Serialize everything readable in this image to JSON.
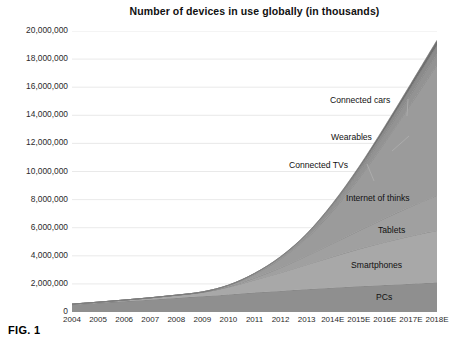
{
  "figure": {
    "caption": "FIG. 1"
  },
  "chart_data": {
    "type": "area",
    "stacked": true,
    "title": "Number of devices in use globally (in thousands)",
    "xlabel": "",
    "ylabel": "",
    "grid": true,
    "legend_position": "inline-annotations",
    "categories": [
      "2004",
      "2005",
      "2006",
      "2007",
      "2008",
      "2009",
      "2010",
      "2011",
      "2012",
      "2013",
      "2014E",
      "2015E",
      "2016E",
      "2017E",
      "2018E"
    ],
    "x": [
      2004,
      2005,
      2006,
      2007,
      2008,
      2009,
      2010,
      2011,
      2012,
      2013,
      2014,
      2015,
      2016,
      2017,
      2018
    ],
    "ylim": [
      0,
      20000000
    ],
    "ytick_values": [
      0,
      2000000,
      4000000,
      6000000,
      8000000,
      10000000,
      12000000,
      14000000,
      16000000,
      18000000,
      20000000
    ],
    "ytick_labels": [
      "0",
      "2,000,000",
      "4,000,000",
      "6,000,000",
      "8,000,000",
      "10,000,000",
      "12,000,000",
      "14,000,000",
      "16,000,000",
      "18,000,000",
      "20,000,000"
    ],
    "series": [
      {
        "name": "PCs",
        "color": "#8f8f8f",
        "values": [
          520000,
          640000,
          760000,
          880000,
          1000000,
          1120000,
          1250000,
          1380000,
          1500000,
          1620000,
          1730000,
          1830000,
          1920000,
          2010000,
          2100000
        ]
      },
      {
        "name": "Smartphones",
        "color": "#a8a8a8",
        "values": [
          40000,
          60000,
          90000,
          130000,
          190000,
          280000,
          520000,
          900000,
          1300000,
          1750000,
          2200000,
          2650000,
          3050000,
          3400000,
          3700000
        ]
      },
      {
        "name": "Tablets",
        "color": "#a0a0a0",
        "values": [
          0,
          0,
          0,
          0,
          0,
          0,
          30000,
          140000,
          350000,
          620000,
          950000,
          1300000,
          1700000,
          2100000,
          2500000
        ]
      },
      {
        "name": "Internet of thinks",
        "color": "#9b9b9b",
        "values": [
          0,
          0,
          0,
          0,
          10000,
          30000,
          90000,
          260000,
          620000,
          1250000,
          2300000,
          3700000,
          5400000,
          7300000,
          9300000
        ]
      },
      {
        "name": "Connected TVs",
        "color": "#939393",
        "values": [
          0,
          0,
          0,
          0,
          0,
          0,
          20000,
          60000,
          130000,
          230000,
          350000,
          470000,
          580000,
          680000,
          760000
        ]
      },
      {
        "name": "Wearables",
        "color": "#8b8b8b",
        "values": [
          0,
          0,
          0,
          0,
          0,
          0,
          0,
          10000,
          30000,
          70000,
          140000,
          240000,
          360000,
          480000,
          600000
        ]
      },
      {
        "name": "Connected cars",
        "color": "#6f6f6f",
        "values": [
          0,
          0,
          0,
          0,
          0,
          0,
          0,
          0,
          10000,
          30000,
          70000,
          130000,
          210000,
          290000,
          380000
        ]
      }
    ],
    "annotations": [
      {
        "label": "Connected cars",
        "text_x": 330,
        "text_y": 95,
        "line_to_x": 407,
        "line_to_y": 116
      },
      {
        "label": "Wearables",
        "text_x": 331,
        "text_y": 132,
        "line_to_x": 392,
        "line_to_y": 151
      },
      {
        "label": "Connected TVs",
        "text_x": 289,
        "text_y": 160,
        "line_to_x": 374,
        "line_to_y": 181
      },
      {
        "label": "Internet of thinks",
        "text_x": 346,
        "text_y": 193,
        "line_to_x": null,
        "line_to_y": null
      },
      {
        "label": "Tablets",
        "text_x": 378,
        "text_y": 225,
        "line_to_x": null,
        "line_to_y": null
      },
      {
        "label": "Smartphones",
        "text_x": 351,
        "text_y": 260,
        "line_to_x": null,
        "line_to_y": null
      },
      {
        "label": "PCs",
        "text_x": 376,
        "text_y": 292,
        "line_to_x": null,
        "line_to_y": null
      }
    ],
    "colors": {
      "grid": "#e3e3e3",
      "axis": "#9a9a9a",
      "plot_background": "#ffffff",
      "leader_line": "#b0b0b0"
    }
  }
}
